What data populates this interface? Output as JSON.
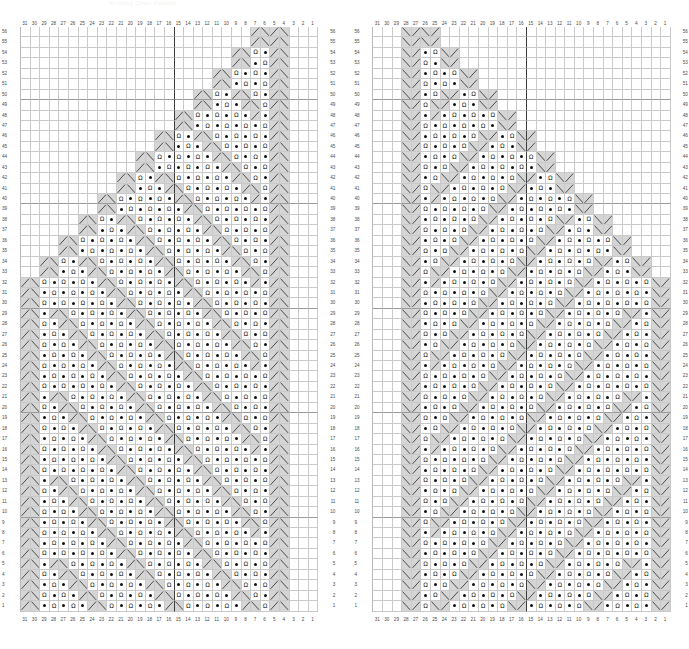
{
  "title": "Knitting Chart Pattern",
  "colors": {
    "grid_line": "#c9c9c9",
    "shaded_cell": "#d5d5d5",
    "cell_background": "#ffffff",
    "center_line": "#3c3c3c",
    "label_text": "#4a4a4a",
    "symbol": "#141414"
  },
  "legend": {
    "symbols": [
      {
        "name": "yarn-over",
        "glyph": "Ω"
      },
      {
        "name": "purl-bead",
        "glyph": "●"
      },
      {
        "name": "left-leaning-decrease",
        "glyph": "\\"
      },
      {
        "name": "right-leaning-decrease",
        "glyph": "/"
      }
    ]
  },
  "chart_data": {
    "type": "table",
    "title": "Knitting Chart Pattern",
    "columns": 31,
    "rows": 56,
    "column_labels": [
      31,
      30,
      29,
      28,
      27,
      26,
      25,
      24,
      23,
      22,
      21,
      20,
      19,
      18,
      17,
      16,
      15,
      14,
      13,
      12,
      11,
      10,
      9,
      8,
      7,
      6,
      5,
      4,
      3,
      2,
      1
    ],
    "row_labels": [
      56,
      55,
      54,
      53,
      52,
      51,
      50,
      49,
      48,
      47,
      46,
      45,
      44,
      43,
      42,
      41,
      40,
      39,
      38,
      37,
      36,
      35,
      34,
      33,
      32,
      31,
      30,
      29,
      28,
      27,
      26,
      25,
      24,
      23,
      22,
      21,
      20,
      19,
      18,
      17,
      16,
      15,
      14,
      13,
      12,
      11,
      10,
      9,
      8,
      7,
      6,
      5,
      4,
      3,
      2,
      1
    ],
    "center_column": 16,
    "charts": [
      {
        "name": "left-chart",
        "apex_side": "right",
        "description": "Triangular lace motif widening from upper-right apex down to the left edge; column numbering 31 at left to 1 at right, rows 1 at bottom to 56 at top."
      },
      {
        "name": "right-chart",
        "apex_side": "left",
        "description": "Mirror image of the left chart; triangular lace motif widening from upper-left apex down to the right edge; same 31x56 grid."
      }
    ]
  }
}
